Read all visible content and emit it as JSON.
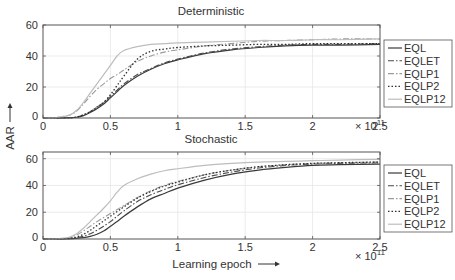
{
  "chart_data": [
    {
      "type": "line",
      "title": "Deterministic",
      "xlabel": "",
      "ylabel": "AAR",
      "xlim": [
        0,
        2.5
      ],
      "ylim": [
        0,
        60
      ],
      "x_multiplier": "× 10^11",
      "xticks": [
        0,
        0.5,
        1,
        1.5,
        2,
        2.5
      ],
      "xtick_labels": [
        "0",
        "0.5",
        "1",
        "1.5",
        "2",
        "2.5"
      ],
      "yticks": [
        0,
        20,
        40,
        60
      ],
      "ytick_labels": [
        "0",
        "20",
        "40",
        "60"
      ],
      "grid": true,
      "legend_position": "right",
      "x": [
        0,
        0.1,
        0.2,
        0.25,
        0.3,
        0.35,
        0.4,
        0.45,
        0.5,
        0.55,
        0.6,
        0.7,
        0.8,
        0.9,
        1.0,
        1.2,
        1.4,
        1.6,
        1.8,
        2.0,
        2.2,
        2.5
      ],
      "series": [
        {
          "name": "EQL",
          "values": [
            0,
            0,
            0.2,
            0.5,
            1.5,
            3.5,
            6,
            9,
            13,
            17,
            21,
            27,
            31.5,
            35,
            37.5,
            41.5,
            44,
            45.5,
            46.5,
            47,
            47,
            47.5
          ]
        },
        {
          "name": "EQLET",
          "values": [
            0,
            0,
            0.2,
            0.6,
            2,
            4,
            7,
            10,
            14,
            18,
            22,
            28,
            32,
            35.5,
            38,
            42,
            44.5,
            46,
            47,
            47.5,
            47.5,
            48
          ]
        },
        {
          "name": "EQLP1",
          "values": [
            0,
            0.3,
            2,
            4.5,
            9,
            14,
            18.5,
            22,
            25.5,
            28,
            31,
            36.5,
            40,
            42.5,
            44,
            46.5,
            48,
            49.5,
            50,
            50.5,
            51,
            51
          ]
        },
        {
          "name": "EQLP2",
          "values": [
            0,
            0,
            0.2,
            0.6,
            2,
            4,
            7,
            10,
            15,
            21,
            27,
            38,
            43,
            44.5,
            45.5,
            46.5,
            47,
            47.5,
            47.5,
            48,
            48,
            48
          ]
        },
        {
          "name": "EQLP12",
          "values": [
            0,
            0.3,
            2,
            5,
            10,
            16,
            22,
            28,
            34,
            40,
            43.5,
            46,
            47.5,
            48,
            48.5,
            49,
            49.5,
            50,
            50,
            50.5,
            50.5,
            51
          ]
        }
      ]
    },
    {
      "type": "line",
      "title": "Stochastic",
      "xlabel": "Learning epoch",
      "ylabel": "AAR",
      "xlim": [
        0,
        2.5
      ],
      "ylim": [
        0,
        65
      ],
      "x_multiplier": "× 10^11",
      "xticks": [
        0,
        0.5,
        1,
        1.5,
        2,
        2.5
      ],
      "xtick_labels": [
        "0",
        "0.5",
        "1",
        "1.5",
        "2",
        "2.5"
      ],
      "yticks": [
        0,
        20,
        40,
        60
      ],
      "ytick_labels": [
        "0",
        "20",
        "40",
        "60"
      ],
      "grid": true,
      "legend_position": "right",
      "x": [
        0,
        0.1,
        0.2,
        0.25,
        0.3,
        0.35,
        0.4,
        0.45,
        0.5,
        0.55,
        0.6,
        0.7,
        0.8,
        0.9,
        1.0,
        1.2,
        1.4,
        1.6,
        1.8,
        2.0,
        2.2,
        2.5
      ],
      "series": [
        {
          "name": "EQL",
          "values": [
            0,
            0,
            0.2,
            0.5,
            1,
            2,
            3.5,
            6,
            9.5,
            13,
            17,
            24,
            30,
            34,
            38,
            44,
            48.5,
            51.5,
            53.5,
            55,
            55.5,
            56
          ]
        },
        {
          "name": "EQLET",
          "values": [
            0,
            0,
            0.3,
            1,
            2,
            4,
            6.5,
            9.5,
            13,
            17,
            21,
            28,
            33,
            37,
            40.5,
            46,
            50,
            53,
            55,
            56,
            56.5,
            57
          ]
        },
        {
          "name": "EQLP1",
          "values": [
            0,
            0.1,
            1,
            3,
            6,
            9.5,
            13,
            16,
            19,
            22,
            25,
            31,
            36,
            40,
            43,
            48,
            51.5,
            54,
            55.5,
            56.5,
            57,
            57.5
          ]
        },
        {
          "name": "EQLP2",
          "values": [
            0,
            0.1,
            0.5,
            1.5,
            3.5,
            6.5,
            10,
            13.5,
            17,
            20.5,
            24,
            30.5,
            35.5,
            39.5,
            42.5,
            48,
            51.5,
            54,
            55.5,
            56.5,
            57,
            57.5
          ]
        },
        {
          "name": "EQLP12",
          "values": [
            0,
            0.2,
            1.5,
            4,
            8,
            13,
            18,
            23,
            28.5,
            35,
            40,
            45,
            48.5,
            51,
            52.5,
            55,
            56.5,
            57.5,
            58,
            58.5,
            59,
            59.5
          ]
        }
      ]
    }
  ],
  "legend": {
    "items": [
      {
        "name": "EQL",
        "label": "EQL",
        "color": "#3a3a3a",
        "dash": "",
        "width": 1.2
      },
      {
        "name": "EQLET",
        "label": "EQLET",
        "color": "#4a4a4a",
        "dash": "6,2,1.5,2",
        "width": 1.1
      },
      {
        "name": "EQLP1",
        "label": "EQLP1",
        "color": "#9a9a9a",
        "dash": "6,2,1.5,2",
        "width": 1.1
      },
      {
        "name": "EQLP2",
        "label": "EQLP2",
        "color": "#2e2e2e",
        "dash": "1.5,2",
        "width": 1.3
      },
      {
        "name": "EQLP12",
        "label": "EQLP12",
        "color": "#bdbdbd",
        "dash": "",
        "width": 1.2
      }
    ]
  },
  "labels": {
    "top_title": "Deterministic",
    "bottom_title": "Stochastic",
    "ylabel": "AAR",
    "xlabel": "Learning epoch",
    "multiplier_base": "× 10",
    "multiplier_exp": "11"
  },
  "colors": {
    "axis": "#555555",
    "grid": "#e6e6e6",
    "text": "#333333"
  }
}
